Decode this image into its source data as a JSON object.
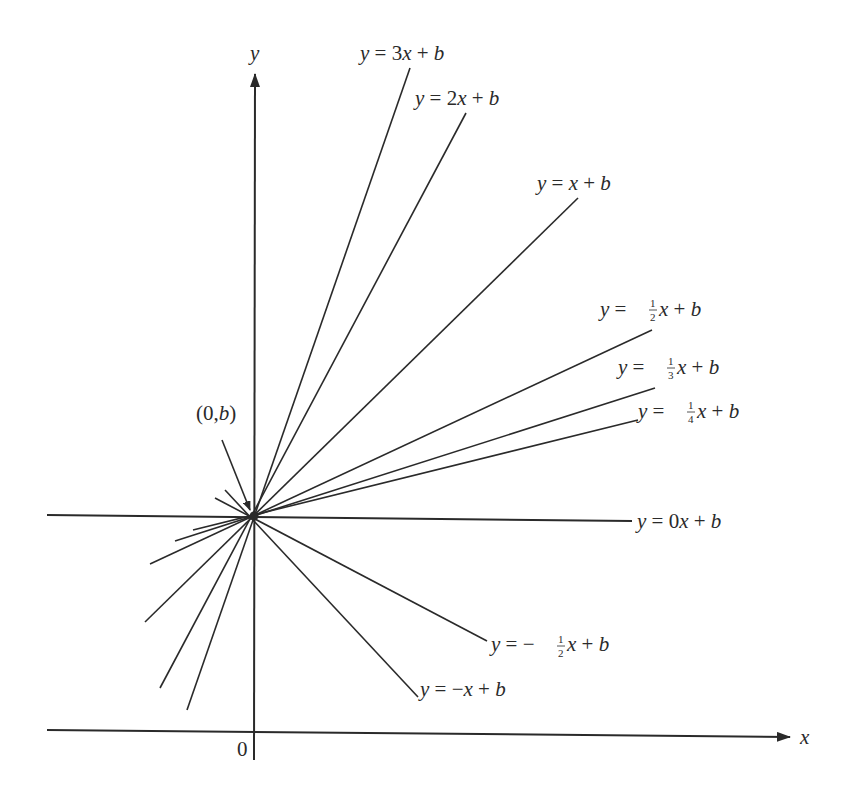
{
  "diagram": {
    "axes": {
      "x_label": "x",
      "y_label": "y",
      "origin_label": "0"
    },
    "point_label": "(0,b)",
    "lines": [
      {
        "id": "slope-3",
        "label": "y = 3x + b",
        "slope": "3"
      },
      {
        "id": "slope-2",
        "label": "y = 2x + b",
        "slope": "2"
      },
      {
        "id": "slope-1",
        "label": "y = x + b",
        "slope": "1"
      },
      {
        "id": "slope-half",
        "label": "y = ½x + b",
        "slope": "1/2"
      },
      {
        "id": "slope-third",
        "label": "y = ⅓x + b",
        "slope": "1/3"
      },
      {
        "id": "slope-quarter",
        "label": "y = ¼x + b",
        "slope": "1/4"
      },
      {
        "id": "slope-0",
        "label": "y = 0x + b",
        "slope": "0"
      },
      {
        "id": "slope-neg-half",
        "label": "y = −½x + b",
        "slope": "-1/2"
      },
      {
        "id": "slope-neg-1",
        "label": "y = −x + b",
        "slope": "-1"
      }
    ],
    "colors": {
      "ink": "#2a2a2a",
      "background": "#ffffff"
    }
  }
}
